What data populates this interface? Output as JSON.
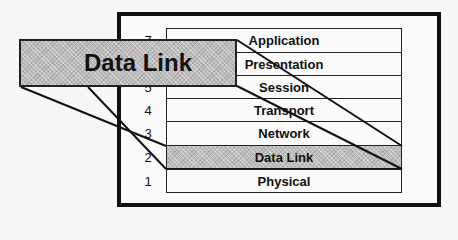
{
  "diagram": {
    "callout_label": "Data Link",
    "highlight_color": "#bdbdbd",
    "layers": [
      {
        "number": "7",
        "name": "Application",
        "highlighted": false
      },
      {
        "number": "6",
        "name": "Presentation",
        "highlighted": false
      },
      {
        "number": "5",
        "name": "Session",
        "highlighted": false
      },
      {
        "number": "4",
        "name": "Transport",
        "highlighted": false
      },
      {
        "number": "3",
        "name": "Network",
        "highlighted": false
      },
      {
        "number": "2",
        "name": "Data Link",
        "highlighted": true
      },
      {
        "number": "1",
        "name": "Physical",
        "highlighted": false
      }
    ]
  }
}
